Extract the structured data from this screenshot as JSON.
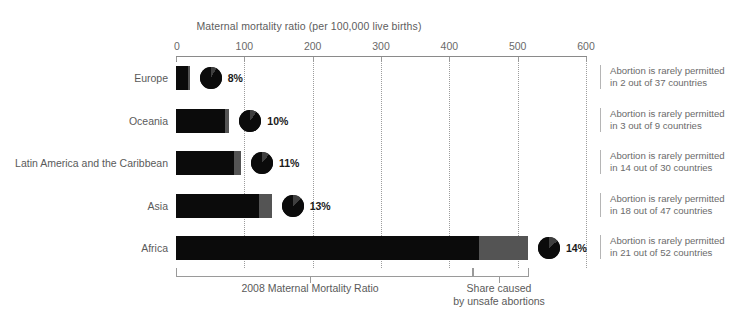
{
  "chart_data": {
    "type": "bar",
    "title": "Maternal mortality ratio (per 100,000 live births)",
    "xlabel": "Maternal mortality ratio (per 100,000 live births)",
    "ylabel": "",
    "xlim": [
      0,
      600
    ],
    "ticks": [
      0,
      100,
      200,
      300,
      400,
      500,
      600
    ],
    "grid": true,
    "legend_position": "bottom",
    "categories": [
      "Europe",
      "Oceania",
      "Latin America and the Caribbean",
      "Asia",
      "Africa"
    ],
    "series": [
      {
        "name": "2008 Maternal Mortality Ratio",
        "color": "#0b0b0b",
        "values": [
          18,
          72,
          85,
          122,
          443
        ]
      },
      {
        "name": "Share caused by unsafe abortions",
        "color": "#545454",
        "values": [
          2,
          6,
          10,
          18,
          72
        ]
      }
    ],
    "totals": [
      20,
      78,
      95,
      140,
      515
    ],
    "markers": {
      "label": "Share caused by unsafe abortions (pie)",
      "values": [
        8,
        10,
        11,
        13,
        14
      ],
      "labels": [
        "8%",
        "10%",
        "11%",
        "13%",
        "14%"
      ]
    },
    "annotations": [
      "Abortion is rarely permitted in 2 out of 37 countries",
      "Abortion is rarely permitted in 3 out of 9 countries",
      "Abortion is rarely permitted in 14 out of 30 countries",
      "Abortion is rarely permitted in 18 out of 47 countries",
      "Abortion is rarely permitted in 21 out of 52 countries"
    ]
  },
  "axis": {
    "title": "Maternal mortality ratio (per 100,000 live births)",
    "tick_labels": [
      "0",
      "100",
      "200",
      "300",
      "400",
      "500",
      "600"
    ]
  },
  "rows": [
    {
      "category": "Europe",
      "safe": 18,
      "unsafe": 2,
      "total": 20,
      "pct_label": "8%",
      "pct": 8,
      "note_line1": "Abortion is rarely permitted",
      "note_line2": "in 2 out of 37 countries"
    },
    {
      "category": "Oceania",
      "safe": 72,
      "unsafe": 6,
      "total": 78,
      "pct_label": "10%",
      "pct": 10,
      "note_line1": "Abortion is rarely permitted",
      "note_line2": "in 3 out of 9 countries"
    },
    {
      "category": "Latin America and the Caribbean",
      "safe": 85,
      "unsafe": 10,
      "total": 95,
      "pct_label": "11%",
      "pct": 11,
      "note_line1": "Abortion is rarely permitted",
      "note_line2": "in 14 out of 30 countries"
    },
    {
      "category": "Asia",
      "safe": 122,
      "unsafe": 18,
      "total": 140,
      "pct_label": "13%",
      "pct": 13,
      "note_line1": "Abortion is rarely permitted",
      "note_line2": "in 18 out of 47 countries"
    },
    {
      "category": "Africa",
      "safe": 443,
      "unsafe": 72,
      "total": 515,
      "pct_label": "14%",
      "pct": 14,
      "note_line1": "Abortion is rarely permitted",
      "note_line2": "in 21 out of 52 countries"
    }
  ],
  "footer": {
    "left_caption": "2008 Maternal Mortality Ratio",
    "right_caption_line1": "Share caused",
    "right_caption_line2": "by unsafe abortions"
  },
  "colors": {
    "bar_safe": "#0b0b0b",
    "bar_unsafe": "#545454",
    "pie_main": "#0b0b0b",
    "pie_wedge": "#3f3f3f",
    "axis": "#8a8a8a",
    "grid": "#9c9c9c",
    "text": "#5a5a5a"
  }
}
